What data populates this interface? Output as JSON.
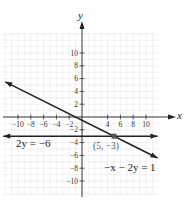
{
  "chart_data": {
    "type": "line",
    "title": "",
    "xlabel": "x",
    "ylabel": "y",
    "xlim": [
      -12,
      12
    ],
    "ylim": [
      -12,
      13
    ],
    "grid": true,
    "x_ticks": [
      -10,
      -8,
      -6,
      -4,
      -2,
      4,
      6,
      8,
      10
    ],
    "x_tick_labels": [
      "−10",
      "−8",
      "−6",
      "−4",
      "−2",
      "4",
      "6",
      "8",
      "10"
    ],
    "y_ticks": [
      10,
      8,
      6,
      4,
      2,
      -2,
      -4,
      -6,
      -8,
      -10
    ],
    "y_tick_labels": [
      "10",
      "8",
      "6",
      "4",
      "2",
      "−2",
      "−4",
      "−6",
      "−8",
      "−10"
    ],
    "series": [
      {
        "name": "−x − 2y = 1",
        "equation": "-x - 2y = 1",
        "x": [
          -12,
          11.8
        ],
        "y": [
          5.5,
          -6.4
        ],
        "arrows": "both"
      },
      {
        "name": "2y = −6",
        "equation": "2y = -6",
        "x": [
          -12.3,
          11.8
        ],
        "y": [
          -3,
          -3
        ],
        "arrows": "both"
      }
    ],
    "annotations": [
      {
        "text": "(5, −3)",
        "x": 5,
        "y": -3,
        "type": "intersection-point"
      }
    ]
  },
  "labels": {
    "x_axis": "x",
    "y_axis": "y",
    "line1": "−x − 2y = 1",
    "line2": "2y = −6",
    "point": "(5, −3)"
  },
  "colors": {
    "axis": "#222222",
    "line": "#222222",
    "grid": "#d9d9d9",
    "point": "#555555"
  }
}
